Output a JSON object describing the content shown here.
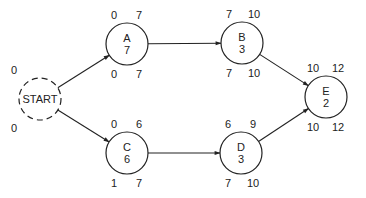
{
  "diagram": {
    "type": "activity-on-node network (critical path)",
    "nodes": [
      {
        "id": "START",
        "name": "START",
        "duration": null,
        "dashed": true,
        "es": "0",
        "lf": "0"
      },
      {
        "id": "A",
        "name": "A",
        "duration": "7",
        "es": "0",
        "ef": "7",
        "ls": "0",
        "lf": "7"
      },
      {
        "id": "B",
        "name": "B",
        "duration": "3",
        "es": "7",
        "ef": "10",
        "ls": "7",
        "lf": "10"
      },
      {
        "id": "C",
        "name": "C",
        "duration": "6",
        "es": "0",
        "ef": "6",
        "ls": "1",
        "lf": "7"
      },
      {
        "id": "D",
        "name": "D",
        "duration": "3",
        "es": "6",
        "ef": "9",
        "ls": "7",
        "lf": "10"
      },
      {
        "id": "E",
        "name": "E",
        "duration": "2",
        "es": "10",
        "ef": "12",
        "ls": "10",
        "lf": "12"
      }
    ],
    "edges": [
      {
        "from": "START",
        "to": "A"
      },
      {
        "from": "START",
        "to": "C"
      },
      {
        "from": "A",
        "to": "B"
      },
      {
        "from": "C",
        "to": "D"
      },
      {
        "from": "B",
        "to": "E"
      },
      {
        "from": "D",
        "to": "E"
      }
    ]
  }
}
